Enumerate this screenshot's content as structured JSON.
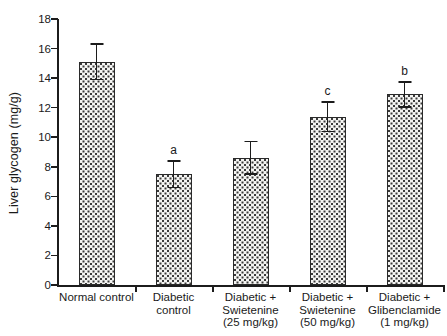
{
  "chart_data": {
    "type": "bar",
    "title": "",
    "xlabel": "",
    "ylabel": "Liver glycogen (mg/g)",
    "ylim": [
      0,
      18
    ],
    "ytick_values": [
      0,
      2,
      4,
      6,
      8,
      10,
      12,
      14,
      16,
      18
    ],
    "ytick_labels": [
      "0",
      "2",
      "4",
      "6",
      "8",
      "10",
      "12",
      "14",
      "16",
      "18"
    ],
    "grid": false,
    "legend": "none",
    "categories": [
      "Normal control",
      "Diabetic\ncontrol",
      "Diabetic +\nSwietenine\n(25 mg/kg)",
      "Diabetic +\nSwietenine\n(50 mg/kg)",
      "Diabetic +\nGlibenclamide\n(1 mg/kg)"
    ],
    "values": [
      15.1,
      7.5,
      8.6,
      11.4,
      12.9
    ],
    "errors": [
      1.2,
      0.9,
      1.1,
      1.0,
      0.85
    ],
    "annotations": [
      "",
      "a",
      "",
      "c",
      "b"
    ],
    "bar_fill": "dotted-stipple",
    "bar_edge_color": "#2a2a2a",
    "axis_color": "#1c1c1c"
  }
}
